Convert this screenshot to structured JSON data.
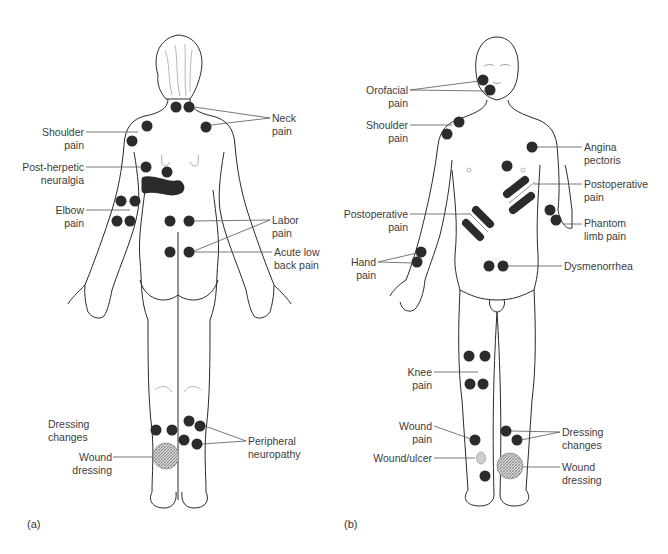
{
  "figure": {
    "panels": [
      {
        "id": "a",
        "caption": "(a)",
        "view": "posterior",
        "labels": {
          "neck_pain": "Neck\npain",
          "shoulder_pain": "Shoulder\npain",
          "post_herpetic": "Post-herpetic\nneuralgia",
          "elbow_pain": "Elbow\npain",
          "labor_pain": "Labor\npain",
          "acute_low_back_pain": "Acute low\nback pain",
          "dressing_changes": "Dressing\nchanges",
          "wound_dressing": "Wound\ndressing",
          "peripheral_neuropathy": "Peripheral\nneuropathy"
        }
      },
      {
        "id": "b",
        "caption": "(b)",
        "view": "anterior",
        "labels": {
          "orofacial_pain": "Orofacial\npain",
          "shoulder_pain": "Shoulder\npain",
          "angina_pectoris": "Angina\npectoris",
          "postoperative_pain_right": "Postoperative\npain",
          "postoperative_pain_left": "Postoperative\npain",
          "phantom_limb_pain": "Phantom\nlimb pain",
          "hand_pain": "Hand\npain",
          "dysmenorrhea": "Dysmenorrhea",
          "knee_pain": "Knee\npain",
          "wound_pain": "Wound\npain",
          "wound_ulcer": "Wound/ulcer",
          "dressing_changes": "Dressing\nchanges",
          "wound_dressing": "Wound\ndressing"
        }
      }
    ],
    "colors": {
      "marker": "#2b2b2b",
      "outline": "#2a2a2a",
      "leader": "#555555",
      "ulcer": "#cfcfcf",
      "dressing": "#9a9a9a"
    }
  }
}
